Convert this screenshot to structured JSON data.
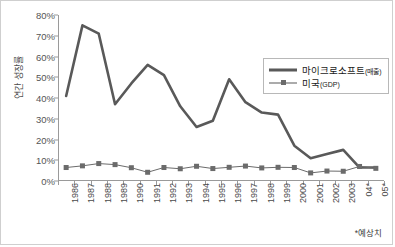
{
  "chart_data": {
    "type": "line",
    "title": "",
    "xlabel": "",
    "ylabel": "연간 성장률",
    "ylim": [
      0,
      80
    ],
    "yticks": [
      "0%",
      "10%",
      "20%",
      "30%",
      "40%",
      "50%",
      "60%",
      "70%",
      "80%"
    ],
    "ytick_values": [
      0,
      10,
      20,
      30,
      40,
      50,
      60,
      70,
      80
    ],
    "grid": false,
    "legend_position": "upper-right-inside",
    "categories": [
      "1986",
      "1987",
      "1988",
      "1989",
      "1990",
      "1991",
      "1992",
      "1993",
      "1994",
      "1995",
      "1996",
      "1997",
      "1998",
      "1999",
      "2000",
      "2001",
      "2002",
      "2003",
      "04*",
      "05*"
    ],
    "series": [
      {
        "name": "마이크로소프트(매출)",
        "name_main": "마이크로소프트",
        "name_sub": "(매출)",
        "color": "#595959",
        "marker": "none",
        "values": [
          41,
          75,
          71,
          37,
          47,
          56,
          51,
          36,
          26,
          29,
          49,
          38,
          33,
          32,
          17,
          11,
          13,
          15,
          6.5,
          6.5
        ]
      },
      {
        "name": "미국(GDP)",
        "name_main": "미국",
        "name_sub": "(GDP)",
        "color": "#6b6b6b",
        "marker": "square",
        "values": [
          6.5,
          7.3,
          8.4,
          7.9,
          6.4,
          4.2,
          6.5,
          5.9,
          7.1,
          6.0,
          6.6,
          7.2,
          6.3,
          6.6,
          6.5,
          3.9,
          4.8,
          4.7,
          7.0,
          6.1
        ]
      }
    ],
    "footnote": "*예상치"
  }
}
